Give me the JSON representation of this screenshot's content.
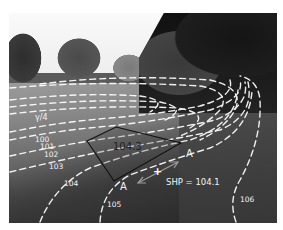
{
  "figure": {
    "contour_labels": [
      {
        "value": "100",
        "x": 35,
        "y": 136
      },
      {
        "value": "101",
        "x": 40,
        "y": 143
      },
      {
        "value": "102",
        "x": 44,
        "y": 151
      },
      {
        "value": "103",
        "x": 49,
        "y": 165
      },
      {
        "value": "104",
        "x": 64,
        "y": 180
      },
      {
        "value": "105",
        "x": 107,
        "y": 202
      },
      {
        "value": "106",
        "x": 240,
        "y": 197
      }
    ],
    "small_mark": "γ/4",
    "area_label": "104.3",
    "section_labels": {
      "a_right": "A",
      "a_left": "A"
    },
    "point_marker": "+",
    "shp_label": "SHP = 104.1",
    "colors": {
      "contour_line": "#ffffff",
      "area_outline": "#111111",
      "label_text": "#f4f4f4",
      "arrow": "#bdbdbd"
    }
  }
}
